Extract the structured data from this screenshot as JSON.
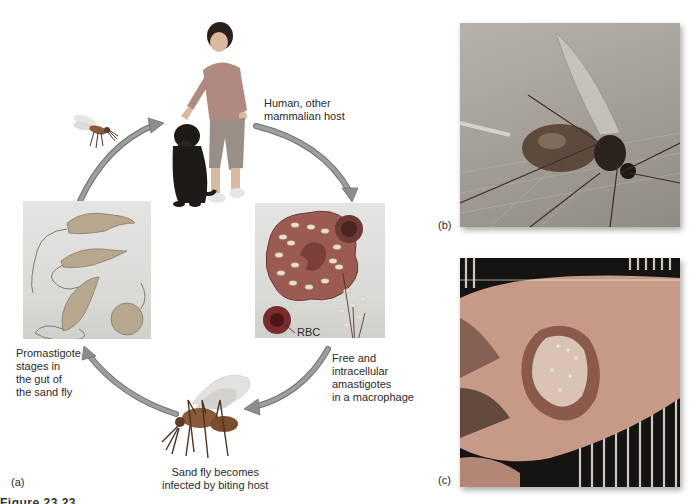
{
  "figure": {
    "panels": {
      "a": {
        "panel_label": "(a)",
        "stages": {
          "human_host": "Human, other mammalian host",
          "human_host_line1": "Human, other",
          "human_host_line2": "mammalian host",
          "macrophage": {
            "line1": "Free and",
            "line2": "intracellular",
            "line3": "amastigotes",
            "line4": "in a macrophage",
            "rbc_label": "RBC"
          },
          "sand_fly": {
            "line1": "Sand fly becomes",
            "line2": "infected by biting host"
          },
          "promastigote": {
            "line1": "Promastigote",
            "line2": "stages in",
            "line3": "the gut of",
            "line4": "the sand fly"
          }
        }
      },
      "b": {
        "panel_label": "(b)"
      },
      "c": {
        "panel_label": "(c)"
      }
    },
    "caption_clipped": "Figure 23.23"
  },
  "colors": {
    "arrow": "#8a8e8c",
    "arrow_edge": "#6d716f",
    "macrophage": "#9b5a52",
    "macrophage_dark": "#6e3a35",
    "rbc": "#7a2b2b",
    "amastigote": "#e8e1cf",
    "promastigote": "#b7a78f",
    "sandfly_body": "#8a5a3a",
    "dog": "#1e1a18",
    "shirt": "#b08a80",
    "pants": "#9a8f86",
    "skin": "#d9b9a0",
    "lesion": "#b9897a",
    "photo_b_bg": "#a9a59d"
  }
}
